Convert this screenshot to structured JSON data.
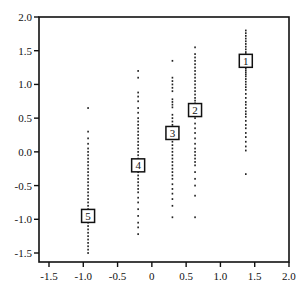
{
  "chart_data": {
    "type": "scatter",
    "title": "",
    "xlabel": "",
    "ylabel": "",
    "xlim": [
      -1.6,
      2.0
    ],
    "ylim": [
      -1.65,
      2.0
    ],
    "grid": false,
    "legend": null,
    "x_ticks": [
      -1.5,
      -1.0,
      -0.5,
      0.0,
      0.5,
      1.0,
      1.5,
      2.0
    ],
    "x_tick_labels": [
      "-1.5",
      "-1.0",
      "-0.5",
      "0",
      "0.5",
      "1.0",
      "1.5",
      "2.0"
    ],
    "y_ticks": [
      -1.5,
      -1.0,
      -0.5,
      0.0,
      0.5,
      1.0,
      1.5,
      2.0
    ],
    "y_tick_labels": [
      "-1.5",
      "-1.0",
      "-0.5",
      "0.0",
      "0.5",
      "1.0",
      "1.5",
      "2.0"
    ],
    "markers": [
      {
        "label": "1",
        "x": 1.37,
        "y": 1.35
      },
      {
        "label": "2",
        "x": 0.63,
        "y": 0.62
      },
      {
        "label": "3",
        "x": 0.3,
        "y": 0.28
      },
      {
        "label": "4",
        "x": -0.2,
        "y": -0.2
      },
      {
        "label": "5",
        "x": -0.93,
        "y": -0.95
      }
    ],
    "columns": [
      {
        "group": "1",
        "x": 1.37,
        "y_min": -0.33,
        "y_max": 1.8,
        "y": [
          1.8,
          1.76,
          1.72,
          1.68,
          1.64,
          1.6,
          1.56,
          1.52,
          1.48,
          1.45,
          1.42,
          1.4,
          1.38,
          1.36,
          1.33,
          1.3,
          1.27,
          1.24,
          1.21,
          1.18,
          1.15,
          1.12,
          1.08,
          1.04,
          1.0,
          0.96,
          0.92,
          0.86,
          0.8,
          0.74,
          0.7,
          0.65,
          0.6,
          0.56,
          0.52,
          0.46,
          0.4,
          0.35,
          0.28,
          0.22,
          0.15,
          0.08,
          0.02,
          -0.33
        ]
      },
      {
        "group": "2",
        "x": 0.63,
        "y_min": -0.97,
        "y_max": 1.55,
        "y": [
          1.55,
          1.45,
          1.4,
          1.35,
          1.3,
          1.25,
          1.2,
          1.15,
          1.1,
          1.05,
          1.0,
          0.95,
          0.9,
          0.85,
          0.8,
          0.76,
          0.72,
          0.68,
          0.65,
          0.6,
          0.55,
          0.5,
          0.42,
          0.35,
          0.28,
          0.2,
          0.12,
          0.05,
          0.0,
          -0.05,
          -0.1,
          -0.15,
          -0.2,
          -0.3,
          -0.4,
          -0.5,
          -0.65,
          -0.97
        ]
      },
      {
        "group": "3",
        "x": 0.3,
        "y_min": -0.97,
        "y_max": 1.35,
        "y": [
          1.35,
          1.1,
          1.05,
          1.0,
          0.95,
          0.9,
          0.78,
          0.74,
          0.7,
          0.66,
          0.55,
          0.5,
          0.45,
          0.4,
          0.35,
          0.3,
          0.25,
          0.2,
          0.15,
          0.1,
          0.05,
          0.0,
          -0.05,
          -0.1,
          -0.15,
          -0.2,
          -0.25,
          -0.3,
          -0.35,
          -0.4,
          -0.48,
          -0.55,
          -0.62,
          -0.7,
          -0.8,
          -0.97
        ]
      },
      {
        "group": "4",
        "x": -0.2,
        "y_min": -1.22,
        "y_max": 1.2,
        "y": [
          1.2,
          1.1,
          0.88,
          0.82,
          0.75,
          0.65,
          0.58,
          0.5,
          0.45,
          0.4,
          0.35,
          0.3,
          0.25,
          0.2,
          0.15,
          0.1,
          0.05,
          0.0,
          -0.05,
          -0.1,
          -0.15,
          -0.25,
          -0.3,
          -0.35,
          -0.4,
          -0.45,
          -0.5,
          -0.55,
          -0.6,
          -0.68,
          -0.75,
          -0.85,
          -0.95,
          -1.05,
          -1.12,
          -1.22
        ]
      },
      {
        "group": "5",
        "x": -0.93,
        "y_min": -1.5,
        "y_max": 0.65,
        "y": [
          0.65,
          0.3,
          0.2,
          0.12,
          0.05,
          0.0,
          -0.05,
          -0.1,
          -0.15,
          -0.2,
          -0.25,
          -0.3,
          -0.35,
          -0.4,
          -0.45,
          -0.5,
          -0.55,
          -0.6,
          -0.65,
          -0.7,
          -0.75,
          -0.8,
          -0.85,
          -0.9,
          -1.0,
          -1.05,
          -1.1,
          -1.15,
          -1.2,
          -1.25,
          -1.3,
          -1.35,
          -1.4,
          -1.45,
          -1.5
        ]
      }
    ]
  },
  "colors": {
    "axis": "#111111",
    "points": "#222222",
    "marker_fill": "#ffffff",
    "marker_stroke": "#111111",
    "background": "#ffffff"
  }
}
